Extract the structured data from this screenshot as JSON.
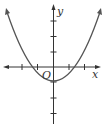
{
  "figure": {
    "type": "function-graph",
    "axes": {
      "x_label": "x",
      "y_label": "y",
      "origin_label": "O",
      "x_ticks": [
        -2,
        -1,
        1,
        2
      ],
      "y_ticks": [
        -3,
        -2,
        -1,
        1,
        2,
        3
      ]
    },
    "curve": {
      "kind": "parabola",
      "opens": "up",
      "vertex": [
        0,
        -1
      ],
      "x_intercepts_approx": [
        -1.4,
        1.4
      ],
      "y_intercept": -1
    },
    "colors": {
      "curve": "#555555",
      "axes": "#333333",
      "background": "#ffffff"
    }
  }
}
